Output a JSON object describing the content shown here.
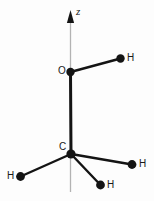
{
  "figure": {
    "width": 154,
    "height": 201,
    "background_color": "#fdfdfd",
    "bond_color": "#141414",
    "atom_color": "#141414",
    "axis_color": "#b3b3b3",
    "label_color": "#1a1a1a"
  },
  "axis": {
    "name": "z-axis",
    "label": "z",
    "label_x": 76,
    "label_y": 6,
    "line_x": 70.5,
    "line_top_y": 14,
    "line_bottom_y": 192,
    "arrow_tip_y": 10,
    "arrow_base_y": 23,
    "arrow_half_width": 3.6
  },
  "atoms": [
    {
      "id": "O1",
      "label": "O",
      "element": "O",
      "x": 70.5,
      "y": 72,
      "radius": 4.2,
      "label_x": 58,
      "label_y": 66
    },
    {
      "id": "H1",
      "label": "H",
      "element": "H",
      "x": 120.5,
      "y": 58.5,
      "radius": 4.2,
      "label_x": 127,
      "label_y": 53
    },
    {
      "id": "C1",
      "label": "C",
      "element": "C",
      "x": 71,
      "y": 154,
      "radius": 4.6,
      "label_x": 59,
      "label_y": 142
    },
    {
      "id": "H2",
      "label": "H",
      "element": "H",
      "x": 20.5,
      "y": 176.5,
      "radius": 4.4,
      "label_x": 7,
      "label_y": 171
    },
    {
      "id": "H3",
      "label": "H",
      "element": "H",
      "x": 132,
      "y": 164.5,
      "radius": 4.4,
      "label_x": 139,
      "label_y": 159
    },
    {
      "id": "H4",
      "label": "H",
      "element": "H",
      "x": 100.5,
      "y": 185,
      "radius": 4.4,
      "label_x": 107,
      "label_y": 180
    }
  ],
  "bonds": [
    {
      "id": "O1-H1",
      "from": "O1",
      "to": "H1",
      "x1": 70.5,
      "y1": 72,
      "x2": 120.5,
      "y2": 58.5,
      "width": 2.4
    },
    {
      "id": "O1-C1",
      "from": "O1",
      "to": "C1",
      "x1": 70.5,
      "y1": 72,
      "x2": 71,
      "y2": 154,
      "width": 3.0
    },
    {
      "id": "C1-H2",
      "from": "C1",
      "to": "H2",
      "x1": 71,
      "y1": 154,
      "x2": 20.5,
      "y2": 176.5,
      "width": 2.4
    },
    {
      "id": "C1-H3",
      "from": "C1",
      "to": "H3",
      "x1": 71,
      "y1": 154,
      "x2": 132,
      "y2": 164.5,
      "width": 2.4
    },
    {
      "id": "C1-H4",
      "from": "C1",
      "to": "H4",
      "x1": 71,
      "y1": 154,
      "x2": 100.5,
      "y2": 185,
      "width": 2.4
    }
  ]
}
